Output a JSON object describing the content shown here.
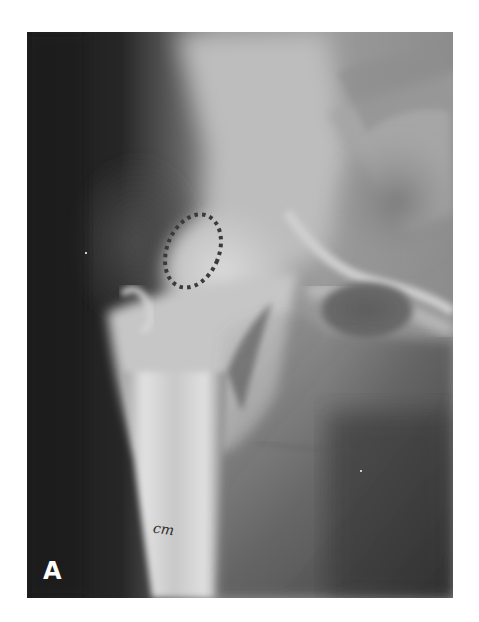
{
  "figure": {
    "panel_label": "A",
    "annotation": {
      "type": "dotted-ellipse",
      "marks": "region of femoral head",
      "color": "#3a3a3a"
    },
    "handwriting": "cm",
    "colors": {
      "background_page": "#ffffff",
      "xray_dark": "#1e1e1e",
      "bone_bright": "#d8d8d8",
      "soft_tissue": "#7a7a7a"
    }
  }
}
